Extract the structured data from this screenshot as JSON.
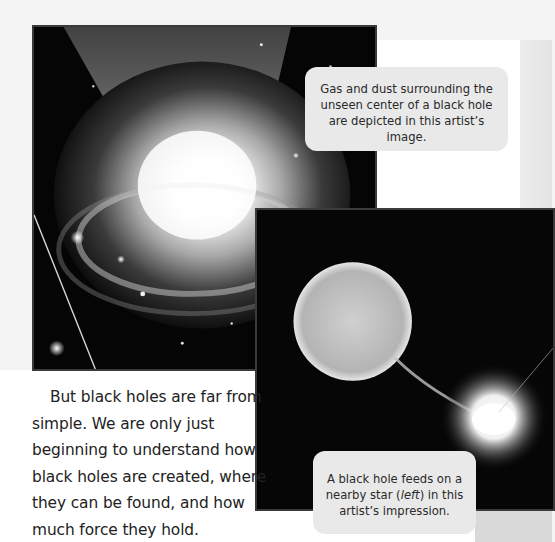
{
  "page": {
    "background": "#f3f3f3",
    "accent_text_color": "#222222",
    "callout_background": "#e9e9e9"
  },
  "images": [
    {
      "name": "gas-dust-black-hole",
      "description": "Artist's image of glowing gas and dust swirling around a black hole's unseen center, with stars in the background"
    },
    {
      "name": "black-hole-feeding-on-star",
      "description": "Artist's impression of a large bright star on the left with a stream of material flowing to a glowing black hole disk on the right"
    }
  ],
  "captions": {
    "top": "Gas and dust surrounding the unseen center of a black hole are depicted in this artist’s image.",
    "bottom_before": "A black hole feeds on a nearby star (",
    "bottom_italic": "left",
    "bottom_after": ") in this artist’s impression."
  },
  "body": {
    "paragraph": "But black holes are far from simple. We are only just beginning to understand how black holes are created, where they can be found, and how much force they hold."
  }
}
